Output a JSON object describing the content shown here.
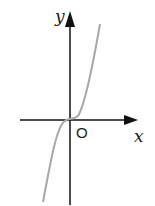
{
  "diagram": {
    "type": "function-graph",
    "axes": {
      "x_label": "x",
      "y_label": "y",
      "origin_label": "O"
    },
    "curve": {
      "shape": "cubic",
      "description": "increasing cubic through origin, flat at origin",
      "color": "#a8a8a8"
    },
    "axis_color": "#111111"
  }
}
